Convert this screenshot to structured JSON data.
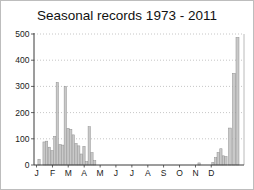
{
  "window": {
    "background": "#ffffff",
    "frame_border_color": "#bdbdbd"
  },
  "chart_data": {
    "type": "bar",
    "title": "Seasonal records 1973 - 2011",
    "xlabel": "",
    "ylabel": "",
    "ylim": [
      0,
      500
    ],
    "yticks": [
      0,
      100,
      200,
      300,
      400,
      500
    ],
    "month_labels": [
      "J",
      "F",
      "M",
      "A",
      "M",
      "J",
      "J",
      "A",
      "S",
      "O",
      "N",
      "D"
    ],
    "month_tick_fracs": [
      0.012,
      0.088,
      0.163,
      0.239,
      0.315,
      0.39,
      0.466,
      0.542,
      0.617,
      0.693,
      0.769,
      0.844
    ],
    "grid": "dotted horizontal gridlines at 100-500, none at 0",
    "legend": "none",
    "colors": {
      "bar_fill": "#c9c9c9",
      "bar_edge": "#8f8f8f",
      "grid": "#b8b8b8",
      "axis": "#3a3a3a",
      "right_border": "#a8a8a8",
      "tick_text": "#1a1a1a"
    },
    "bars": [
      {
        "f": 0.024,
        "v": 22
      },
      {
        "f": 0.048,
        "v": 88
      },
      {
        "f": 0.06,
        "v": 91
      },
      {
        "f": 0.073,
        "v": 68
      },
      {
        "f": 0.086,
        "v": 55
      },
      {
        "f": 0.099,
        "v": 109
      },
      {
        "f": 0.111,
        "v": 315
      },
      {
        "f": 0.124,
        "v": 78
      },
      {
        "f": 0.137,
        "v": 76
      },
      {
        "f": 0.149,
        "v": 300
      },
      {
        "f": 0.162,
        "v": 140
      },
      {
        "f": 0.175,
        "v": 136
      },
      {
        "f": 0.187,
        "v": 115
      },
      {
        "f": 0.2,
        "v": 82
      },
      {
        "f": 0.213,
        "v": 73
      },
      {
        "f": 0.225,
        "v": 42
      },
      {
        "f": 0.238,
        "v": 71
      },
      {
        "f": 0.251,
        "v": 13
      },
      {
        "f": 0.263,
        "v": 146
      },
      {
        "f": 0.276,
        "v": 47
      },
      {
        "f": 0.289,
        "v": 17
      },
      {
        "f": 0.786,
        "v": 8
      },
      {
        "f": 0.852,
        "v": 10
      },
      {
        "f": 0.865,
        "v": 28
      },
      {
        "f": 0.877,
        "v": 48
      },
      {
        "f": 0.89,
        "v": 62
      },
      {
        "f": 0.902,
        "v": 35
      },
      {
        "f": 0.914,
        "v": 32
      },
      {
        "f": 0.933,
        "v": 141,
        "w": 3
      },
      {
        "f": 0.952,
        "v": 350,
        "w": 3
      },
      {
        "f": 0.969,
        "v": 487,
        "w": 3
      }
    ]
  }
}
